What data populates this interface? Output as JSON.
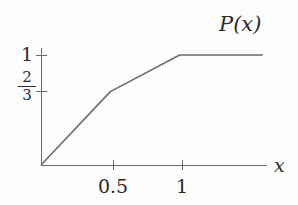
{
  "figure": {
    "title_label": "P(x)",
    "x_axis_label": "x",
    "background_color": "#fdfdfc",
    "line_color": "#6b6b6b",
    "text_color": "#2b2b2b"
  },
  "axes": {
    "y_ticks": [
      {
        "label": "1",
        "value": 1
      },
      {
        "numerator": "2",
        "denominator": "3",
        "value": 0.6667
      }
    ],
    "x_ticks": [
      {
        "label": "0.5",
        "value": 0.5
      },
      {
        "label": "1",
        "value": 1
      }
    ]
  },
  "chart_data": {
    "type": "line",
    "title": "P(x)",
    "xlabel": "x",
    "ylabel": "P(x)",
    "x": [
      0,
      0.5,
      1,
      1.6
    ],
    "y": [
      0,
      0.6667,
      1,
      1
    ],
    "series": [
      {
        "name": "P(x)",
        "points": [
          {
            "x": 0,
            "y": 0
          },
          {
            "x": 0.5,
            "y": 0.6667
          },
          {
            "x": 1,
            "y": 1
          },
          {
            "x": 1.6,
            "y": 1
          }
        ]
      }
    ],
    "xlim": [
      0,
      1.63
    ],
    "ylim": [
      0,
      1.1
    ],
    "xticks": [
      0.5,
      1
    ],
    "xticklabels": [
      "0.5",
      "1"
    ],
    "yticks": [
      0.6667,
      1
    ],
    "yticklabels": [
      "2/3",
      "1"
    ],
    "grid": false,
    "legend": null,
    "annotations": []
  }
}
